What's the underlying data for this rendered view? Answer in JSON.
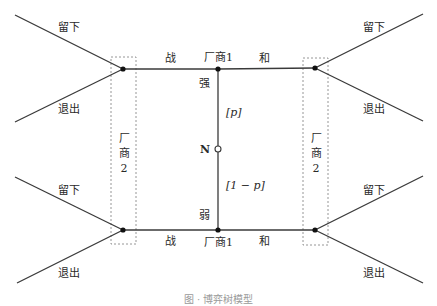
{
  "diagram": {
    "type": "game-tree",
    "chance_node": {
      "label": "N"
    },
    "firm1": {
      "label": "厂商1"
    },
    "firm2": {
      "label_lines": [
        "厂",
        "商",
        "2"
      ]
    },
    "nature_branches": {
      "strong": {
        "label": "强",
        "prob": "[p]"
      },
      "weak": {
        "label": "弱",
        "prob": "[1 − p]"
      }
    },
    "firm1_actions": {
      "fight": "战",
      "peace": "和"
    },
    "firm2_actions": {
      "stay": "留下",
      "exit": "退出"
    },
    "colors": {
      "line": "#3a3a3a",
      "dashed_box": "#8a8a8a",
      "node": "#111111"
    }
  },
  "caption": {
    "text": "图 · 博弈树模型"
  }
}
